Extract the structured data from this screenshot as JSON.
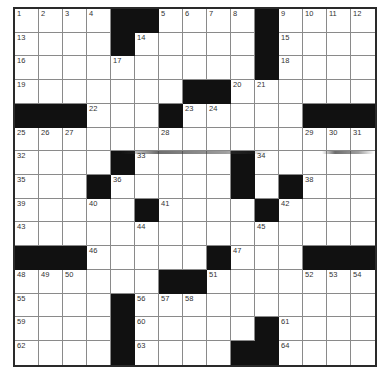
{
  "puzzle": {
    "rows": 15,
    "cols": 15,
    "grid": [
      "....##....#....",
      "....#.....#....",
      "..........#....",
      ".......##......",
      "###...#.....###",
      "...............",
      "....#....#.....",
      "...#.....#.#...",
      ".....#....#....",
      "...............",
      "###.....#...###",
      "......##.......",
      "....#..........",
      "....#.....#....",
      "....#....##...."
    ],
    "numbers": [
      [
        1,
        2,
        3,
        4,
        null,
        null,
        5,
        6,
        7,
        8,
        null,
        9,
        10,
        11,
        12
      ],
      [
        13,
        null,
        null,
        null,
        null,
        14,
        null,
        null,
        null,
        null,
        null,
        15,
        null,
        null,
        null
      ],
      [
        16,
        null,
        null,
        null,
        17,
        null,
        null,
        null,
        null,
        null,
        null,
        18,
        null,
        null,
        null
      ],
      [
        19,
        null,
        null,
        null,
        null,
        null,
        null,
        null,
        null,
        20,
        21,
        null,
        null,
        null,
        null
      ],
      [
        null,
        null,
        null,
        22,
        null,
        null,
        null,
        23,
        24,
        null,
        null,
        null,
        null,
        null,
        null
      ],
      [
        25,
        26,
        27,
        null,
        null,
        null,
        28,
        null,
        null,
        null,
        null,
        null,
        29,
        30,
        31
      ],
      [
        32,
        null,
        null,
        null,
        null,
        33,
        null,
        null,
        null,
        null,
        34,
        null,
        null,
        null,
        null
      ],
      [
        35,
        null,
        null,
        null,
        36,
        null,
        null,
        null,
        null,
        37,
        null,
        null,
        38,
        null,
        null
      ],
      [
        39,
        null,
        null,
        40,
        null,
        null,
        41,
        null,
        null,
        null,
        null,
        42,
        null,
        null,
        null
      ],
      [
        43,
        null,
        null,
        null,
        null,
        44,
        null,
        null,
        null,
        null,
        45,
        null,
        null,
        null,
        null
      ],
      [
        null,
        null,
        null,
        46,
        null,
        null,
        null,
        null,
        null,
        47,
        null,
        null,
        null,
        null,
        null
      ],
      [
        48,
        49,
        50,
        null,
        null,
        null,
        null,
        null,
        51,
        null,
        null,
        null,
        52,
        53,
        54
      ],
      [
        55,
        null,
        null,
        null,
        null,
        56,
        57,
        58,
        null,
        null,
        null,
        null,
        null,
        null,
        null
      ],
      [
        59,
        null,
        null,
        null,
        null,
        60,
        null,
        null,
        null,
        null,
        null,
        61,
        null,
        null,
        null
      ],
      [
        62,
        null,
        null,
        null,
        null,
        63,
        null,
        null,
        null,
        null,
        null,
        64,
        null,
        null,
        null
      ]
    ]
  },
  "colors": {
    "black_square": "#111111",
    "grid_line": "#8a8a8a",
    "border": "#2a2a2a",
    "background": "#ffffff"
  }
}
